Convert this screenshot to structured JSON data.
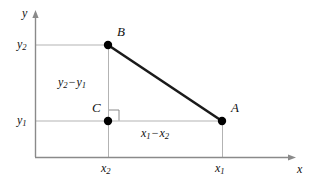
{
  "figure": {
    "type": "coordinate-geometry-diagram",
    "background_color": "#ffffff",
    "axis_color": "#8a8a8a",
    "helper_line_color": "#b3b3b3",
    "segment_color": "#1a1a1a",
    "point_color": "#000000",
    "axes": {
      "y_axis_label": "y",
      "x_axis_label": "x",
      "y_tick_upper": "y",
      "y_tick_upper_sub": "2",
      "y_tick_lower": "y",
      "y_tick_lower_sub": "1",
      "x_tick_left": "x",
      "x_tick_left_sub": "2",
      "x_tick_right": "x",
      "x_tick_right_sub": "1"
    },
    "points": [
      {
        "name": "B",
        "label": "B",
        "x": 108,
        "y": 45
      },
      {
        "name": "A",
        "label": "A",
        "x": 222,
        "y": 121
      },
      {
        "name": "C",
        "label": "C",
        "x": 108,
        "y": 121
      }
    ],
    "annotations": {
      "vertical_leg": {
        "first": "y",
        "first_sub": "2",
        "operator": "−",
        "second": "y",
        "second_sub": "1"
      },
      "horizontal_leg": {
        "first": "x",
        "first_sub": "1",
        "operator": "−",
        "second": "x",
        "second_sub": "2"
      }
    },
    "right_angle_marker": {
      "name": "right-angle-at-C",
      "size": 10
    }
  }
}
